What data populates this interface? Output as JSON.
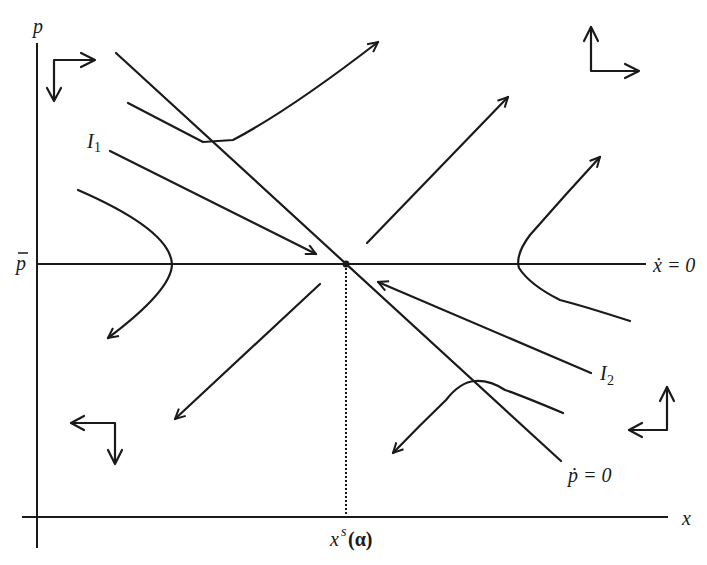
{
  "diagram": {
    "type": "phase-diagram",
    "axes": {
      "x_label": "x",
      "y_label": "p"
    },
    "labels": {
      "p_bar": "p",
      "x_dot_eq": "ẋ = 0",
      "p_dot_eq": "ṗ = 0",
      "I1_main": "I",
      "I1_sub": "1",
      "I2_main": "I",
      "I2_sub": "2",
      "xs_main": "x",
      "xs_sup": "s",
      "xs_arg": "(α)"
    },
    "loci": [
      {
        "name": "x-dot-zero",
        "description": "horizontal line at p-bar"
      },
      {
        "name": "p-dot-zero",
        "description": "downward sloping line through equilibrium"
      }
    ],
    "equilibrium": {
      "label": "x^s(α), p-bar"
    },
    "stable_arms": [
      "I1",
      "I2"
    ],
    "direction_indicators": [
      "top-left: right & down",
      "top-right: up & right",
      "bottom-left: left & down",
      "bottom-right: left & up"
    ],
    "stroke_color": "#1a1a1a",
    "background_color": "#ffffff"
  }
}
